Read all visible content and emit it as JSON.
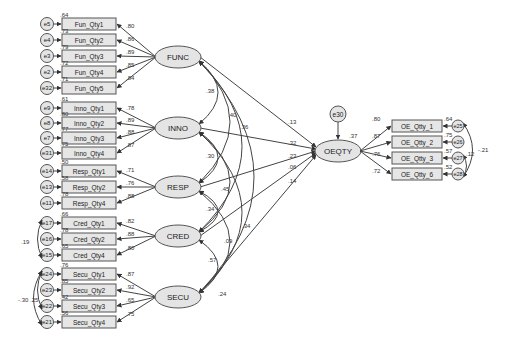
{
  "colors": {
    "node_fill": "#e4e4e4",
    "stroke": "#555555",
    "background": "#ffffff"
  },
  "latents": [
    {
      "id": "FUNC",
      "label": "FUNC",
      "x": 178,
      "y": 57
    },
    {
      "id": "INNO",
      "label": "INNO",
      "x": 178,
      "y": 128
    },
    {
      "id": "RESP",
      "label": "RESP",
      "x": 178,
      "y": 187
    },
    {
      "id": "CRED",
      "label": "CRED",
      "x": 178,
      "y": 236
    },
    {
      "id": "SECU",
      "label": "SECU",
      "x": 178,
      "y": 297
    },
    {
      "id": "OEQTY",
      "label": "OEQTY",
      "x": 338,
      "y": 151
    }
  ],
  "indicator_groups": [
    {
      "latent": "FUNC",
      "items": [
        {
          "label": "Fun_Qty1",
          "error": "e5",
          "loading": ".80",
          "r2": ".64",
          "y": 24
        },
        {
          "label": "Fun_Qty2",
          "error": "e4",
          "loading": ".86",
          "r2": ".73",
          "y": 40
        },
        {
          "label": "Fun_Qty3",
          "error": "e3",
          "loading": ".89",
          "r2": ".79",
          "y": 56
        },
        {
          "label": "Fun_Qty4",
          "error": "e2",
          "loading": ".85",
          "r2": ".72",
          "y": 72
        },
        {
          "label": "Fun_Qty5",
          "error": "e32",
          "loading": ".84",
          "r2": ".71",
          "y": 88
        }
      ]
    },
    {
      "latent": "INNO",
      "items": [
        {
          "label": "Inno_Qty1",
          "error": "e9",
          "loading": ".78",
          "r2": ".61",
          "y": 108
        },
        {
          "label": "Inno_Qty2",
          "error": "e8",
          "loading": ".89",
          "r2": ".80",
          "y": 123
        },
        {
          "label": "Inno_Qty3",
          "error": "e7",
          "loading": ".88",
          "r2": ".77",
          "y": 138
        },
        {
          "label": "Inno_Qty4",
          "error": "e31",
          "loading": ".87",
          "r2": ".75",
          "y": 153
        }
      ]
    },
    {
      "latent": "RESP",
      "items": [
        {
          "label": "Resp_Qty1",
          "error": "e14",
          "loading": ".71",
          "r2": ".50",
          "y": 171
        },
        {
          "label": "Resp_Qty2",
          "error": "e13",
          "loading": ".76",
          "r2": ".58",
          "y": 187
        },
        {
          "label": "Resp_Qty4",
          "error": "e11",
          "loading": ".88",
          "r2": ".78",
          "y": 203
        }
      ]
    },
    {
      "latent": "CRED",
      "items": [
        {
          "label": "Cred_Qty1",
          "error": "e17",
          "loading": ".82",
          "r2": ".66",
          "y": 223
        },
        {
          "label": "Cred_Qty2",
          "error": "e16",
          "loading": ".88",
          "r2": ".78",
          "y": 239
        },
        {
          "label": "Cred_Qty4",
          "error": "e15",
          "loading": ".80",
          "r2": ".65",
          "y": 255
        }
      ]
    },
    {
      "latent": "SECU",
      "items": [
        {
          "label": "Secu_Qty1",
          "error": "e24",
          "loading": ".87",
          "r2": ".76",
          "y": 274
        },
        {
          "label": "Secu_Qty2",
          "error": "e23",
          "loading": ".92",
          "r2": ".85",
          "y": 290
        },
        {
          "label": "Secu_Qty3",
          "error": "e22",
          "loading": ".65",
          "r2": ".42",
          "y": 306
        },
        {
          "label": "Secu_Qty4",
          "error": "e21",
          "loading": ".75",
          "r2": ".56",
          "y": 322
        }
      ]
    }
  ],
  "outcome_indicators": [
    {
      "label": "OE_Qtty_1",
      "error": "e25",
      "loading": ".80",
      "r2": ".64",
      "y": 126
    },
    {
      "label": "OE_Qtty_2",
      "error": "e26",
      "loading": ".87",
      "r2": ".75",
      "y": 142
    },
    {
      "label": "OE_Qtty_3",
      "error": "e27",
      "loading": ".76",
      "r2": ".57",
      "y": 158
    },
    {
      "label": "OE_Qtty_6",
      "error": "e28",
      "loading": ".72",
      "r2": ".52",
      "y": 174
    }
  ],
  "structural_paths": [
    {
      "from": "FUNC",
      "to": "OEQTY",
      "coef": ".13"
    },
    {
      "from": "INNO",
      "to": "OEQTY",
      "coef": ".32"
    },
    {
      "from": "RESP",
      "to": "OEQTY",
      "coef": ".23"
    },
    {
      "from": "CRED",
      "to": "OEQTY",
      "coef": ".06"
    },
    {
      "from": "SECU",
      "to": "OEQTY",
      "coef": ".14"
    }
  ],
  "outcome_error": {
    "label": "e30",
    "r2": ".37"
  },
  "latent_correlations": [
    {
      "a": "FUNC",
      "b": "INNO",
      "value": ".38"
    },
    {
      "a": "FUNC",
      "b": "RESP",
      "value": ".40"
    },
    {
      "a": "FUNC",
      "b": "CRED",
      "value": ".36"
    },
    {
      "a": "FUNC",
      "b": "SECU",
      "value": ".34"
    },
    {
      "a": "INNO",
      "b": "RESP",
      "value": ".30"
    },
    {
      "a": "INNO",
      "b": "CRED",
      "value": ".45"
    },
    {
      "a": "INNO",
      "b": "SECU",
      "value": ".09"
    },
    {
      "a": "RESP",
      "b": "CRED",
      "value": ".34"
    },
    {
      "a": "RESP",
      "b": "SECU",
      "value": ".24"
    },
    {
      "a": "CRED",
      "b": "SECU",
      "value": ".57"
    }
  ],
  "error_covariances": [
    {
      "a": "e17",
      "b": "e15",
      "value": ".19"
    },
    {
      "a": "e24",
      "b": "e21",
      "value": "-.30"
    },
    {
      "a": "e24",
      "b": "e22",
      "value": ".25"
    },
    {
      "a": "e25",
      "b": "e28",
      "value": "-.21"
    },
    {
      "a": "e27",
      "b": "e28",
      "value": ".12"
    }
  ]
}
